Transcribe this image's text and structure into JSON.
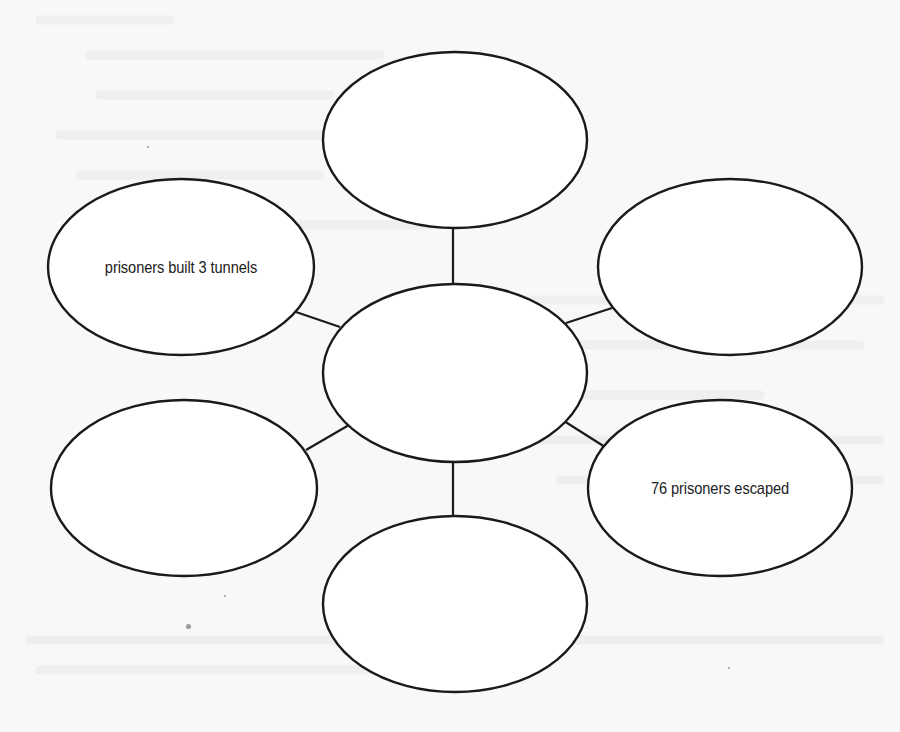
{
  "diagram": {
    "type": "web-organizer",
    "colors": {
      "background": "#f7f8f9",
      "stroke": "#1a1a1a",
      "text": "#222222",
      "fill": "#ffffff"
    },
    "center_node": {
      "label": "",
      "cx": 455,
      "cy": 373,
      "rx": 132,
      "ry": 89
    },
    "nodes": [
      {
        "id": "top",
        "label": "",
        "cx": 455,
        "cy": 140,
        "rx": 132,
        "ry": 88
      },
      {
        "id": "upper-left",
        "label": "prisoners built 3 tunnels",
        "cx": 181,
        "cy": 267,
        "rx": 133,
        "ry": 88
      },
      {
        "id": "upper-right",
        "label": "",
        "cx": 730,
        "cy": 267,
        "rx": 132,
        "ry": 88
      },
      {
        "id": "lower-left",
        "label": "",
        "cx": 184,
        "cy": 488,
        "rx": 133,
        "ry": 88
      },
      {
        "id": "lower-right",
        "label": "76 prisoners escaped",
        "cx": 720,
        "cy": 488,
        "rx": 132,
        "ry": 88
      },
      {
        "id": "bottom",
        "label": "",
        "cx": 455,
        "cy": 604,
        "rx": 132,
        "ry": 88
      }
    ],
    "connectors": [
      {
        "from": "center",
        "to": "top",
        "x1": 453,
        "y1": 284,
        "x2": 453,
        "y2": 228
      },
      {
        "from": "center",
        "to": "upper-left",
        "x1": 340,
        "y1": 327,
        "x2": 296,
        "y2": 312
      },
      {
        "from": "center",
        "to": "upper-right",
        "x1": 566,
        "y1": 323,
        "x2": 612,
        "y2": 308
      },
      {
        "from": "center",
        "to": "lower-left",
        "x1": 349,
        "y1": 425,
        "x2": 306,
        "y2": 450
      },
      {
        "from": "center",
        "to": "lower-right",
        "x1": 564,
        "y1": 421,
        "x2": 605,
        "y2": 447
      },
      {
        "from": "center",
        "to": "bottom",
        "x1": 453,
        "y1": 461,
        "x2": 453,
        "y2": 516
      }
    ]
  }
}
